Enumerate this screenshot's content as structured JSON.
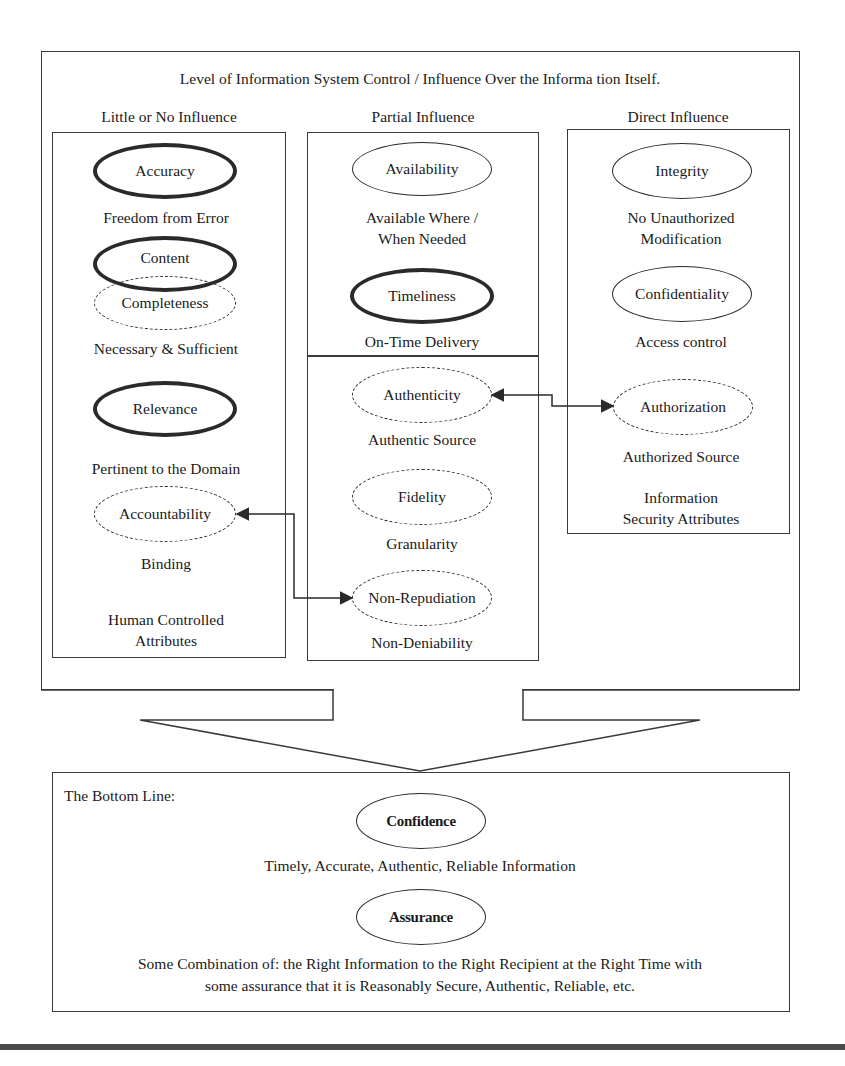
{
  "diagram": {
    "title": "Level of Information System Control / Influence Over the Informa tion Itself.",
    "columns": [
      {
        "heading": "Little or No Influence",
        "footer": [
          "Human Controlled",
          "Attributes"
        ],
        "items": [
          {
            "label": "Accuracy",
            "style": "thick",
            "description": [
              "Freedom from Error"
            ]
          },
          {
            "label": "Content",
            "style": "thick",
            "description": []
          },
          {
            "label": "Completeness",
            "style": "dashed",
            "description": [
              "Necessary & Sufficient"
            ]
          },
          {
            "label": "Relevance",
            "style": "thick",
            "description": [
              "Pertinent to the Domain"
            ]
          },
          {
            "label": "Accountability",
            "style": "dashed",
            "description": [
              "Binding"
            ]
          }
        ]
      },
      {
        "heading": "Partial Influence",
        "items": [
          {
            "label": "Availability",
            "style": "thin",
            "description": [
              "Available Where /",
              "When Needed"
            ]
          },
          {
            "label": "Timeliness",
            "style": "thick",
            "description": [
              "On-Time Delivery"
            ]
          },
          {
            "label": "Authenticity",
            "style": "dashed",
            "description": [
              "Authentic Source"
            ]
          },
          {
            "label": "Fidelity",
            "style": "dashed",
            "description": [
              "Granularity"
            ]
          },
          {
            "label": "Non-Repudiation",
            "style": "dashed",
            "description": [
              "Non-Deniability"
            ]
          }
        ]
      },
      {
        "heading": "Direct Influence",
        "footer": [
          "Information",
          "Security Attributes"
        ],
        "items": [
          {
            "label": "Integrity",
            "style": "thin",
            "description": [
              "No Unauthorized",
              "Modification"
            ]
          },
          {
            "label": "Confidentiality",
            "style": "thin",
            "description": [
              "Access control"
            ]
          },
          {
            "label": "Authorization",
            "style": "dashed",
            "description": [
              "Authorized Source"
            ]
          }
        ]
      }
    ],
    "connectors": [
      {
        "from": "Accountability",
        "to": "Non-Repudiation",
        "bidirectional": true
      },
      {
        "from": "Authenticity",
        "to": "Authorization",
        "bidirectional": true
      }
    ],
    "bottom_line": {
      "label": "The Bottom Line:",
      "confidence": {
        "label": "Confidence",
        "description": "Timely, Accurate, Authentic, Reliable Information"
      },
      "assurance": {
        "label": "Assurance",
        "description": [
          "Some Combination of: the Right Information to the Right Recipient at the Right Time with",
          "some assurance that it is Reasonably Secure, Authentic, Reliable, etc."
        ]
      }
    },
    "colors": {
      "line": "#2a2a2a",
      "background": "#ffffff",
      "text": "#1a1a1a"
    }
  }
}
